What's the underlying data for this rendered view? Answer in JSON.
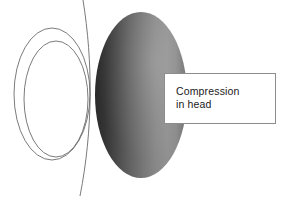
{
  "figure": {
    "background_color": "#ffffff",
    "callout": {
      "label": "Compression\nin head",
      "line1": "Compression",
      "line2": "in head",
      "border_color": "#8c8c8c",
      "fill_color": "#ffffff",
      "x": 164,
      "y": 73,
      "width": 112,
      "height": 51
    },
    "shapes": {
      "outer_ellipse_outline": {
        "name": "outer-ellipse-outline",
        "cx": 52,
        "cy": 94,
        "rx": 38,
        "ry": 66,
        "stroke_color": "#6b6b6b",
        "fill": "none",
        "stroke_width": 0.9
      },
      "inner_ellipse_outline": {
        "name": "inner-ellipse-outline",
        "cx": 56,
        "cy": 99,
        "rx": 32,
        "ry": 58,
        "stroke_color": "#6b6b6b",
        "fill": "none",
        "stroke_width": 0.9
      },
      "vertical_curve": {
        "name": "vertical-curve-line",
        "start": [
          83,
          0
        ],
        "control1": [
          93,
          62
        ],
        "control2": [
          93,
          130
        ],
        "end": [
          80,
          196
        ],
        "stroke_color": "#6b6b6b",
        "stroke_width": 0.9
      },
      "gradient_ellipse": {
        "name": "head-gradient-ellipse",
        "cx": 141,
        "cy": 95,
        "rx": 46,
        "ry": 83,
        "gradient_stops": [
          {
            "offset": "0%",
            "color": "#2e2e2e"
          },
          {
            "offset": "18%",
            "color": "#3c3c3c"
          },
          {
            "offset": "45%",
            "color": "#6f6f6f"
          },
          {
            "offset": "68%",
            "color": "#8a8a8a"
          },
          {
            "offset": "85%",
            "color": "#8f8f8f"
          },
          {
            "offset": "100%",
            "color": "#737373"
          }
        ]
      }
    }
  }
}
